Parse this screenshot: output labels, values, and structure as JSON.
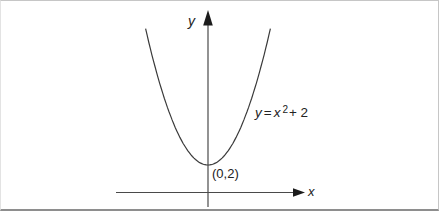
{
  "figure": {
    "y_axis_label": "y",
    "x_axis_label": "x",
    "vertex_label": "(0,2)",
    "equation": {
      "lhs": "y",
      "equals": "=",
      "base": "x",
      "exponent": "2",
      "tail": "+ 2"
    }
  },
  "colors": {
    "curve": "#3a3a3a",
    "axis": "#4a4a4a",
    "arrowhead": "#1c1c1c",
    "text": "#222222",
    "frame_border": "#c6c6c6",
    "frame_border_bottom": "#8e8e8e",
    "background": "#ffffff"
  },
  "chart_data": {
    "type": "line",
    "title": "",
    "curve_label": "y = x² + 2",
    "function": {
      "expression": "y = x^2 + 2",
      "coefficients": {
        "a": 1,
        "b": 0,
        "c": 2
      }
    },
    "xlabel": "x",
    "ylabel": "y",
    "vertex": {
      "x": 0,
      "y": 2,
      "label": "(0,2)"
    },
    "x_visible_range": [
      -3.12,
      3.12
    ],
    "y_visible_range": [
      0,
      11.7
    ],
    "sample_points": {
      "x": [
        -3,
        -2,
        -1,
        0,
        1,
        2,
        3
      ],
      "y": [
        11,
        6,
        3,
        2,
        3,
        6,
        11
      ]
    },
    "grid": false,
    "axis_ticks": "none",
    "legend": "none"
  }
}
